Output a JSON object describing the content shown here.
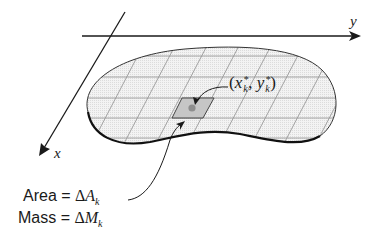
{
  "figure": {
    "axes": {
      "x_label": "x",
      "y_label": "y"
    },
    "region": {
      "fill_color": "#f0f0f0",
      "grid_color": "#9a9a9a",
      "outline_color": "#222222",
      "highlight_color": "#c8c8c8",
      "point_color": "#8a8a8a"
    },
    "point_label": {
      "open": "(",
      "x": "x",
      "x_sub": "k",
      "x_sup": "*",
      "sep": ", ",
      "y": "y",
      "y_sub": "k",
      "y_sup": "*",
      "close": ")"
    },
    "annotations": [
      {
        "name": "area",
        "label": "Area = ",
        "delta": "Δ",
        "symbol": "A",
        "sub": "k"
      },
      {
        "name": "mass",
        "label": "Mass = ",
        "delta": "Δ",
        "symbol": "M",
        "sub": "k"
      }
    ]
  }
}
